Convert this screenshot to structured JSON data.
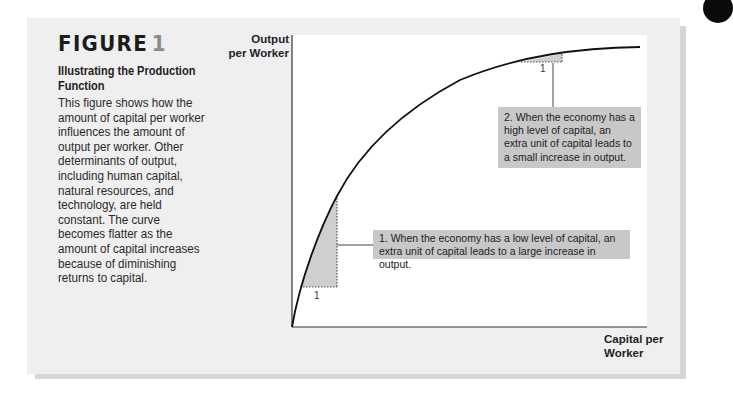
{
  "figure": {
    "title_word": "FIGURE",
    "title_number": "1",
    "subtitle": "Illustrating the Production Function",
    "caption": "This figure shows how the amount of capital per worker influences the amount of output per worker. Other determinants of output, including human capital, natural resources, and technology, are held constant. The curve becomes flatter as the amount of capital increases because of diminishing returns to capital."
  },
  "chart_data": {
    "type": "line",
    "title": "Illustrating the Production Function",
    "xlabel": "Capital per Worker",
    "ylabel": "Output per Worker",
    "grid": false,
    "legend": null,
    "axis_ticks": "none (qualitative axes)",
    "series": [
      {
        "name": "Production function",
        "shape": "concave, increasing at a decreasing rate",
        "points_px": [
          [
            292,
            327
          ],
          [
            296,
            300
          ],
          [
            300,
            287
          ],
          [
            310,
            258
          ],
          [
            320,
            228
          ],
          [
            330,
            204
          ],
          [
            337,
            194
          ],
          [
            350,
            170
          ],
          [
            370,
            140
          ],
          [
            390,
            122
          ],
          [
            410,
            108
          ],
          [
            435,
            93
          ],
          [
            460,
            80
          ],
          [
            495,
            69
          ],
          [
            521,
            62
          ],
          [
            530,
            60
          ],
          [
            562,
            54
          ],
          [
            600,
            50
          ],
          [
            640,
            48
          ]
        ]
      }
    ],
    "annotations": [
      {
        "id": 1,
        "text": "1. When the economy has a low level of capital, an extra unit of capital leads to a large increase in output.",
        "unit_label": "1",
        "triangle": "large shaded rise near origin"
      },
      {
        "id": 2,
        "text": "2. When the economy has a high level of capital, an extra unit of capital leads to a small increase in output.",
        "unit_label": "1",
        "triangle": "small shaded rise near top"
      }
    ]
  },
  "colors": {
    "panel": "#efefef",
    "panel_shadow": "#d6d6d6",
    "chart_bg": "#ffffff",
    "callout": "#c8c8c8",
    "triangle_fill": "#cfcfcf",
    "curve": "#111111"
  }
}
